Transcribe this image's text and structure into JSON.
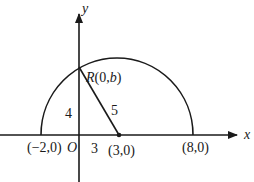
{
  "diagram": {
    "type": "coordinate-geometry",
    "axes": {
      "x_label": "x",
      "y_label": "y",
      "origin_label": "O"
    },
    "semicircle": {
      "center": "(3,0)",
      "radius": 5,
      "left_endpoint": "(-2,0)",
      "right_endpoint": "(8,0)"
    },
    "points": {
      "R": "R(0,b)",
      "center": "(3,0)",
      "left": "(−2,0)",
      "right": "(8,0)"
    },
    "segment_labels": {
      "vertical": "4",
      "horizontal": "3",
      "hypotenuse": "5"
    }
  }
}
